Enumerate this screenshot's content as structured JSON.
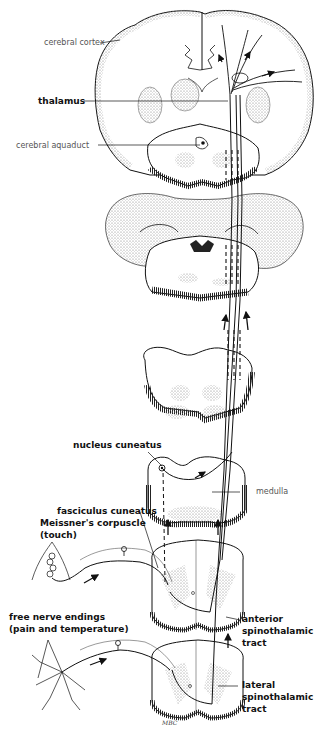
{
  "figure": {
    "signature": "MBC"
  },
  "labels": {
    "cerebral_cortex": "cerebral cortex",
    "thalamus": "thalamus",
    "cerebral_aquaduct": "cerebral aquaduct",
    "nucleus_cuneatus": "nucleus cuneatus",
    "medulla": "medulla",
    "fasciculus_cuneatus": "fasciculus cuneatus",
    "meissners_corpuscle": "Meissner's corpuscle",
    "meissners_corpuscle_note": "(touch)",
    "free_nerve_endings": "free nerve endings",
    "free_nerve_endings_note": "(pain and temperature)",
    "anterior_tract_line1": "anterior",
    "anterior_tract_line2": "spinothalamic",
    "anterior_tract_line3": "tract",
    "lateral_tract_line1": "lateral",
    "lateral_tract_line2": "spinothalamic",
    "lateral_tract_line3": "tract"
  },
  "colors": {
    "ink": "#111111",
    "stipple": "#9a9a9a",
    "background": "#ffffff"
  }
}
